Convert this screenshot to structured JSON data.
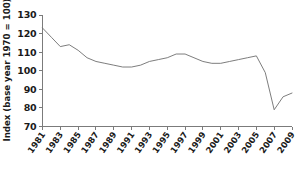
{
  "chart_data": {
    "type": "line",
    "title": "",
    "xlabel": "",
    "ylabel": "Index (base year 1970 = 100)",
    "ylim": [
      70,
      130
    ],
    "xlim": [
      1981,
      2009
    ],
    "grid": false,
    "legend": null,
    "yticks": [
      130,
      120,
      110,
      100,
      90,
      80,
      70
    ],
    "xticks": [
      "1981",
      "1983",
      "1985",
      "1987",
      "1989",
      "1991",
      "1993",
      "1995",
      "1997",
      "1999",
      "2001",
      "2003",
      "2005",
      "2007",
      "2009"
    ],
    "x": [
      1981,
      1982,
      1983,
      1984,
      1985,
      1986,
      1987,
      1988,
      1989,
      1990,
      1991,
      1992,
      1993,
      1994,
      1995,
      1996,
      1997,
      1998,
      1999,
      2000,
      2001,
      2002,
      2003,
      2004,
      2005,
      2006,
      2007,
      2008,
      2009
    ],
    "values": [
      123,
      118,
      113,
      114,
      111,
      107,
      105,
      104,
      103,
      102,
      102,
      103,
      105,
      106,
      107,
      109,
      109,
      107,
      105,
      104,
      104,
      105,
      106,
      107,
      108,
      99,
      79,
      86,
      88
    ],
    "series": [
      {
        "name": "index",
        "color": "#6e6e6e",
        "values": [
          123,
          118,
          113,
          114,
          111,
          107,
          105,
          104,
          103,
          102,
          102,
          103,
          105,
          106,
          107,
          109,
          109,
          107,
          105,
          104,
          104,
          105,
          106,
          107,
          108,
          99,
          79,
          86,
          88
        ]
      }
    ]
  },
  "colors": {
    "line": "#6e6e6e",
    "axis": "#7b7b7b",
    "text": "#1a1a1a",
    "background": "#ffffff"
  }
}
